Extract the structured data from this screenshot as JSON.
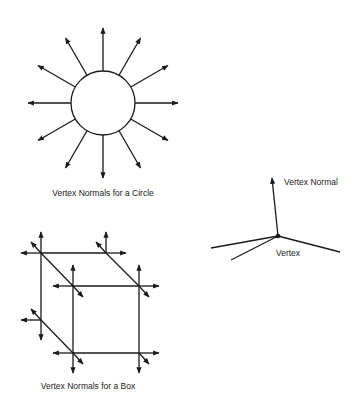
{
  "colors": {
    "stroke": "#1a1a1a",
    "text": "#222222",
    "background": "#ffffff"
  },
  "circle_figure": {
    "caption": "Vertex Normals for a Circle",
    "center": [
      103,
      103
    ],
    "radius": 32,
    "normal_length": 75,
    "normal_count": 12,
    "normal_angles_deg": [
      0,
      30,
      60,
      90,
      120,
      150,
      180,
      210,
      240,
      270,
      300,
      330
    ]
  },
  "box_figure": {
    "caption": "Vertex Normals for a Box",
    "vertices": {
      "back_top_left": [
        41,
        253
      ],
      "back_top_right": [
        106,
        253
      ],
      "back_bottom_left": [
        41,
        320
      ],
      "front_top_left": [
        73,
        286
      ],
      "front_top_right": [
        139,
        286
      ],
      "front_bottom_left": [
        73,
        353
      ],
      "front_bottom_right": [
        139,
        353
      ]
    }
  },
  "vertex_figure": {
    "normal_label": "Vertex Normal",
    "vertex_label": "Vertex",
    "vertex": [
      278,
      236
    ],
    "normal_tip": [
      272,
      178
    ],
    "edges": [
      [
        211,
        248
      ],
      [
        231,
        260
      ],
      [
        340,
        252
      ]
    ]
  }
}
